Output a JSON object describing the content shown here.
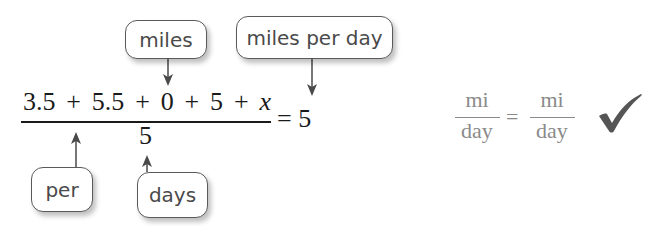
{
  "callouts": {
    "miles": "miles",
    "miles_per_day": "miles per day",
    "per": "per",
    "days": "days"
  },
  "equation": {
    "numerator": [
      "3.5",
      "+",
      "5.5",
      "+",
      "0",
      "+",
      "5",
      "+",
      "x"
    ],
    "denominator": "5",
    "equals": "=",
    "rhs": "5"
  },
  "unit_check": {
    "left_numerator": "mi",
    "left_denominator": "day",
    "equals": "=",
    "right_numerator": "mi",
    "right_denominator": "day",
    "check_icon": "checkmark-icon",
    "check_color": "#555555"
  }
}
